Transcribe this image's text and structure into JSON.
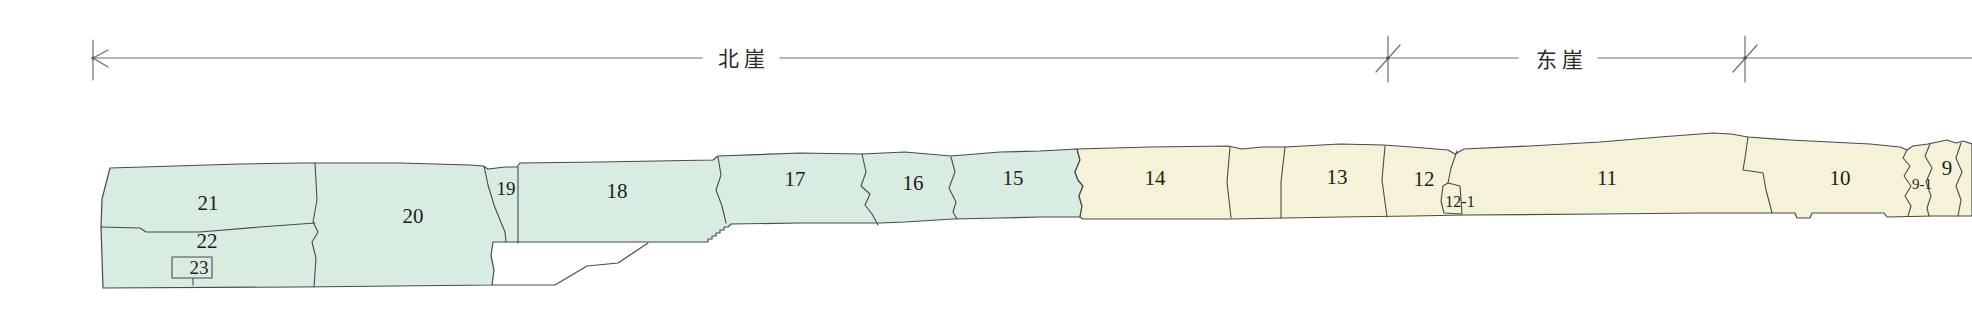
{
  "figure": {
    "dimension": {
      "north_cliff_label": "北崖",
      "east_cliff_label": "东崖"
    },
    "sections": {
      "s9": "9",
      "s9_1": "9-1",
      "s10": "10",
      "s11": "11",
      "s12": "12",
      "s12_1": "12-1",
      "s13": "13",
      "s14": "14",
      "s15": "15",
      "s16": "16",
      "s17": "17",
      "s18": "18",
      "s19": "19",
      "s20": "20",
      "s21": "21",
      "s22": "22",
      "s23": "23"
    },
    "colors": {
      "north_cliff_fill": "#d8ece2",
      "east_cliff_fill": "#f5f2d8",
      "outline": "#4a4a4a",
      "background": "#ffffff"
    }
  }
}
